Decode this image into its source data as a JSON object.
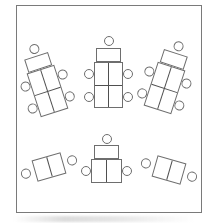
{
  "diagram": {
    "type": "classroom-seating-plan",
    "background": "#ffffff",
    "room_border": {
      "x": 16,
      "y": 5,
      "width": 186,
      "height": 208,
      "color": "#7a7a7a"
    },
    "style": {
      "line_color": "#6e6e6e",
      "divider_color": "#4f4f4f",
      "desk_fill": "#ffffff",
      "scan_smudge_color": "#bfbfbf"
    },
    "groups": [
      {
        "id": "desk-cluster-top-left",
        "type": "cluster-5",
        "desks": 5,
        "chairs": 5,
        "left": 23,
        "top": 41,
        "rotation": -18
      },
      {
        "id": "desk-cluster-top-center",
        "type": "cluster-5",
        "desks": 5,
        "chairs": 5,
        "left": 84,
        "top": 35,
        "rotation": 0
      },
      {
        "id": "desk-cluster-top-right",
        "type": "cluster-5",
        "desks": 5,
        "chairs": 5,
        "left": 140,
        "top": 38,
        "rotation": 18
      },
      {
        "id": "desk-table-bottom-left",
        "type": "table-2",
        "desks": 2,
        "chairs": 2,
        "left": 20,
        "top": 156,
        "rotation": -16
      },
      {
        "id": "desk-cluster-bottom-center",
        "type": "cluster-3",
        "desks": 3,
        "chairs": 3,
        "left": 81,
        "top": 133,
        "rotation": 0
      },
      {
        "id": "desk-table-bottom-right",
        "type": "table-2",
        "desks": 2,
        "chairs": 2,
        "left": 140,
        "top": 159,
        "rotation": 16
      }
    ]
  }
}
